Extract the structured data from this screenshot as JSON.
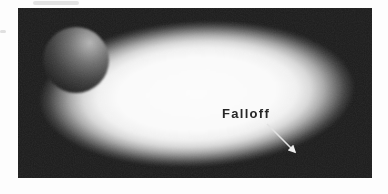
{
  "figure": {
    "label": "Falloff",
    "description_icon": "falloff-arrow-icon",
    "colors": {
      "page_background": "#fdfdfd",
      "frame_background": "#1b1b1b",
      "glow_center": "#fcfcfc",
      "sphere_highlight": "#b4b4b4",
      "label_text": "#262626",
      "arrow": "#e2e2e2"
    }
  }
}
